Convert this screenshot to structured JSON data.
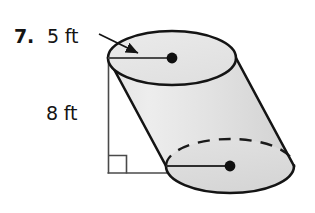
{
  "figure": {
    "problem_number": "7.",
    "radius_label": "5 ft",
    "height_label": "8 ft",
    "shape_name": "oblique-cylinder",
    "colors": {
      "outline": "#141414",
      "body_fill_light": "#ececec",
      "body_fill_dark": "#d4d4d4",
      "top_face_fill": "#e6e6e6",
      "measure_line": "#4a4a4a",
      "text": "#141414",
      "background": "#ffffff"
    },
    "geometry": {
      "top_ellipse": {
        "cx": 172,
        "cy": 58,
        "rx": 64,
        "ry": 27
      },
      "bottom_ellipse": {
        "cx": 230,
        "cy": 166,
        "rx": 64,
        "ry": 27
      },
      "height_line": {
        "x": 108,
        "y_top": 58,
        "y_bottom": 173
      },
      "base_line": {
        "y": 173,
        "x_start": 108,
        "x_end": 232
      },
      "right_angle_marker_size": 18,
      "top_radius_segment": {
        "x1": 108,
        "y1": 58,
        "x2": 172,
        "y2": 58
      },
      "bottom_radius_segment": {
        "x1": 166,
        "y1": 166,
        "x2": 230,
        "y2": 166
      },
      "arrow": {
        "x1": 100,
        "y1": 36,
        "x2": 139,
        "y2": 54
      }
    },
    "annotations": {
      "top_center_dot": "center-point",
      "bottom_center_dot": "center-point",
      "hidden_edge_style": "dashed"
    }
  }
}
